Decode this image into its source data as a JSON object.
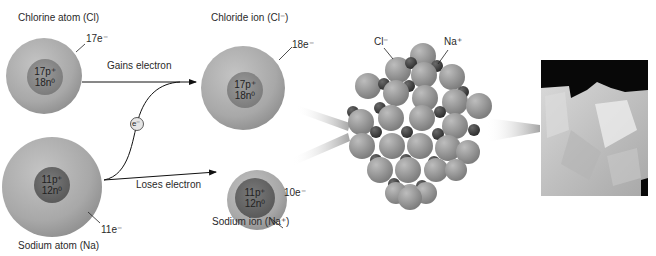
{
  "chlorine_atom": {
    "label": "Chlorine atom (Cl)",
    "electrons": "17e⁻",
    "protons": "17p⁺",
    "neutrons": "18n⁰"
  },
  "sodium_atom": {
    "label": "Sodium atom (Na)",
    "electrons": "11e⁻",
    "protons": "11p⁺",
    "neutrons": "12n⁰"
  },
  "chloride_ion": {
    "label": "Chloride ion (Cl⁻)",
    "electrons": "18e⁻",
    "protons": "17p⁺",
    "neutrons": "18n⁰"
  },
  "sodium_ion": {
    "label": "Sodium ion (Na⁺)",
    "electrons": "10e⁻",
    "protons": "11p⁺",
    "neutrons": "12n⁰"
  },
  "arrows": {
    "gains": "Gains electron",
    "loses": "Loses electron"
  },
  "electron_token": "e⁻",
  "crystal": {
    "cl_label": "Cl⁻",
    "na_label": "Na⁺"
  },
  "colors": {
    "atom_shell": "#a9a9a9",
    "nucleus": "#8a8a8a",
    "na_nucleus": "#6f6f6f",
    "cl_sphere": "#9c9c9c",
    "na_sphere": "#555555"
  }
}
